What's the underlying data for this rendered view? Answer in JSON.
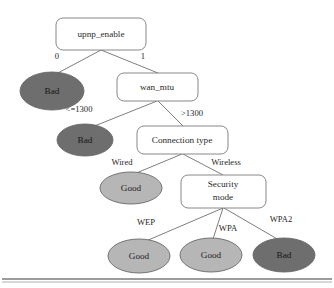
{
  "figure": {
    "type": "decision-tree-diagram",
    "title": "",
    "background_color": "#ffffff"
  },
  "colors": {
    "bad_fill": "#6e6e6e",
    "good_fill": "#b6b6b6",
    "box_fill": "#ffffff",
    "stroke": "#6f6f6f",
    "text": "#2b2b2b",
    "rule": "#3a3a3a"
  },
  "nodes": [
    {
      "id": "upnp_enable",
      "kind": "decision",
      "label": "upnp_enable",
      "shape": "rounded-rect",
      "x": 56,
      "y": 18,
      "w": 90,
      "h": 32
    },
    {
      "id": "bad_1",
      "kind": "leaf",
      "label": "Bad",
      "shape": "ellipse",
      "fill": "bad",
      "cx": 52,
      "cy": 91,
      "rx": 32,
      "ry": 19
    },
    {
      "id": "wan_mtu",
      "kind": "decision",
      "label": "wan_mtu",
      "shape": "rounded-rect",
      "x": 117,
      "y": 73,
      "w": 81,
      "h": 28
    },
    {
      "id": "bad_2",
      "kind": "leaf",
      "label": "Bad",
      "shape": "ellipse",
      "fill": "bad",
      "cx": 85,
      "cy": 140,
      "rx": 28,
      "ry": 16
    },
    {
      "id": "connection_type",
      "kind": "decision",
      "label": "Connection type",
      "shape": "rounded-rect",
      "x": 137,
      "y": 126,
      "w": 91,
      "h": 28
    },
    {
      "id": "good_wired",
      "kind": "leaf",
      "label": "Good",
      "shape": "ellipse",
      "fill": "good",
      "cx": 131,
      "cy": 188,
      "rx": 31,
      "ry": 16
    },
    {
      "id": "security_mode",
      "kind": "decision",
      "label": "Security mode",
      "label_line1": "Security",
      "label_line2": "mode",
      "shape": "rounded-rect",
      "x": 181,
      "y": 175,
      "w": 85,
      "h": 33
    },
    {
      "id": "good_wep",
      "kind": "leaf",
      "label": "Good",
      "shape": "ellipse",
      "fill": "good",
      "cx": 139,
      "cy": 256,
      "rx": 31,
      "ry": 17
    },
    {
      "id": "good_wpa",
      "kind": "leaf",
      "label": "Good",
      "shape": "ellipse",
      "fill": "good",
      "cx": 211,
      "cy": 255,
      "rx": 31,
      "ry": 17
    },
    {
      "id": "bad_wpa2",
      "kind": "leaf",
      "label": "Bad",
      "shape": "ellipse",
      "fill": "bad",
      "cx": 284,
      "cy": 255,
      "rx": 31,
      "ry": 17
    }
  ],
  "edges": [
    {
      "id": "e0",
      "from": "upnp_enable",
      "to": "bad_1",
      "label": "0",
      "label_x": 57,
      "label_y": 57
    },
    {
      "id": "e1",
      "from": "upnp_enable",
      "to": "wan_mtu",
      "label": "1",
      "label_x": 143,
      "label_y": 57
    },
    {
      "id": "e2",
      "from": "wan_mtu",
      "to": "bad_2",
      "label": "<=1300",
      "label_x": 79,
      "label_y": 110
    },
    {
      "id": "e3",
      "from": "wan_mtu",
      "to": "connection_type",
      "label": ">1300",
      "label_x": 192,
      "label_y": 114
    },
    {
      "id": "e4",
      "from": "connection_type",
      "to": "good_wired",
      "label": "Wired",
      "label_x": 122,
      "label_y": 163
    },
    {
      "id": "e5",
      "from": "connection_type",
      "to": "security_mode",
      "label": "Wireless",
      "label_x": 226,
      "label_y": 163
    },
    {
      "id": "e6",
      "from": "security_mode",
      "to": "good_wep",
      "label": "WEP",
      "label_x": 146,
      "label_y": 223
    },
    {
      "id": "e7",
      "from": "security_mode",
      "to": "good_wpa",
      "label": "WPA",
      "label_x": 228,
      "label_y": 229
    },
    {
      "id": "e8",
      "from": "security_mode",
      "to": "bad_wpa2",
      "label": "WPA2",
      "label_x": 281,
      "label_y": 220
    }
  ],
  "labels": {
    "node_upnp_enable": "upnp_enable",
    "node_wan_mtu": "wan_mtu",
    "node_connection_type": "Connection type",
    "node_security_mode_line1": "Security",
    "node_security_mode_line2": "mode",
    "leaf_bad_1": "Bad",
    "leaf_bad_2": "Bad",
    "leaf_good_wired": "Good",
    "leaf_good_wep": "Good",
    "leaf_good_wpa": "Good",
    "leaf_bad_wpa2": "Bad",
    "edge_0": "0",
    "edge_1": "1",
    "edge_le1300": "<=1300",
    "edge_gt1300": ">1300",
    "edge_wired": "Wired",
    "edge_wireless": "Wireless",
    "edge_wep": "WEP",
    "edge_wpa": "WPA",
    "edge_wpa2": "WPA2"
  },
  "footer_rule": {
    "present": true,
    "y_thick": 279,
    "y_thin": 282
  }
}
